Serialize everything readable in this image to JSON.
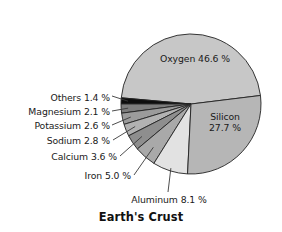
{
  "chart_data": {
    "type": "pie",
    "title": "Earth's Crust",
    "subtitle": "",
    "xlabel": "",
    "ylabel": "",
    "unit": "%",
    "legend": "none",
    "grid": false,
    "start_angle_deg": 7,
    "direction": "counterclockwise",
    "categories": [
      "Oxygen",
      "Silicon",
      "Aluminum",
      "Iron",
      "Calcium",
      "Sodium",
      "Potassium",
      "Magnesium",
      "Others"
    ],
    "values": [
      46.6,
      27.7,
      8.1,
      5.0,
      3.6,
      2.8,
      2.6,
      2.1,
      1.4
    ],
    "slices": [
      {
        "name": "Oxygen",
        "value": 46.6,
        "label": "Oxygen 46.6 %",
        "label_line1": "Oxygen 46.6 %",
        "label_line2": "",
        "label_placement": "inside",
        "color": "#c7c7c7"
      },
      {
        "name": "Others",
        "value": 1.4,
        "label": "Others 1.4 %",
        "label_line1": "Others 1.4 %",
        "label_line2": "",
        "label_placement": "callout-left",
        "color": "#0d0d0d"
      },
      {
        "name": "Magnesium",
        "value": 2.1,
        "label": "Magnesium 2.1 %",
        "label_line1": "Magnesium 2.1 %",
        "label_line2": "",
        "label_placement": "callout-left",
        "color": "#7d7d7d"
      },
      {
        "name": "Potassium",
        "value": 2.6,
        "label": "Potassium 2.6 %",
        "label_line1": "Potassium 2.6 %",
        "label_line2": "",
        "label_placement": "callout-left",
        "color": "#9b9b9b"
      },
      {
        "name": "Sodium",
        "value": 2.8,
        "label": "Sodium 2.8 %",
        "label_line1": "Sodium 2.8 %",
        "label_line2": "",
        "label_placement": "callout-left",
        "color": "#b2b2b2"
      },
      {
        "name": "Calcium",
        "value": 3.6,
        "label": "Calcium 3.6 %",
        "label_line1": "Calcium 3.6 %",
        "label_line2": "",
        "label_placement": "callout-left",
        "color": "#8e8e8e"
      },
      {
        "name": "Iron",
        "value": 5.0,
        "label": "Iron 5.0 %",
        "label_line1": "Iron 5.0 %",
        "label_line2": "",
        "label_placement": "callout-left",
        "color": "#a9a9a9"
      },
      {
        "name": "Aluminum",
        "value": 8.1,
        "label": "Aluminum 8.1 %",
        "label_line1": "Aluminum 8.1 %",
        "label_line2": "",
        "label_placement": "callout-bottom",
        "color": "#e2e2e2"
      },
      {
        "name": "Silicon",
        "value": 27.7,
        "label": "Silicon 27.7 %",
        "label_line1": "Silicon",
        "label_line2": "27.7 %",
        "label_placement": "inside",
        "color": "#b6b6b6"
      }
    ],
    "colors": {
      "outline": "#222222",
      "leader_line": "#3a3a3a",
      "text": "#1a1a1a",
      "background": "#ffffff"
    }
  }
}
